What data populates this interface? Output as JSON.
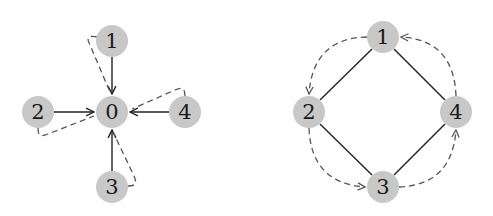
{
  "diagrams": [
    {
      "id": "star-graph",
      "description": "Star graph: center node 0 with spokes from nodes 1-4, each spoke having a dashed return/path loop",
      "nodes": [
        {
          "id": "0",
          "label": "0",
          "x": 112,
          "y": 112
        },
        {
          "id": "1",
          "label": "1",
          "x": 112,
          "y": 41
        },
        {
          "id": "2",
          "label": "2",
          "x": 38,
          "y": 112
        },
        {
          "id": "3",
          "label": "3",
          "x": 112,
          "y": 187
        },
        {
          "id": "4",
          "label": "4",
          "x": 185,
          "y": 112
        }
      ],
      "solid_edges": [
        {
          "from": "1",
          "to": "0",
          "directed": true
        },
        {
          "from": "2",
          "to": "0",
          "directed": true
        },
        {
          "from": "3",
          "to": "0",
          "directed": true
        },
        {
          "from": "4",
          "to": "0",
          "directed": true
        }
      ],
      "dashed_edges": [
        {
          "from": "1",
          "to": "0",
          "style": "hooked dashed curve"
        },
        {
          "from": "2",
          "to": "0",
          "style": "hooked dashed curve"
        },
        {
          "from": "3",
          "to": "0",
          "style": "hooked dashed curve"
        },
        {
          "from": "4",
          "to": "0",
          "style": "hooked dashed curve"
        }
      ]
    },
    {
      "id": "cycle-graph",
      "description": "Cycle graph on nodes 1-4 (diamond) with a dashed directed cycle 1→2→3→4→1 around it",
      "nodes": [
        {
          "id": "1",
          "label": "1",
          "x": 383,
          "y": 37
        },
        {
          "id": "2",
          "label": "2",
          "x": 309,
          "y": 112
        },
        {
          "id": "3",
          "label": "3",
          "x": 383,
          "y": 187
        },
        {
          "id": "4",
          "label": "4",
          "x": 456,
          "y": 112
        }
      ],
      "solid_edges": [
        {
          "from": "1",
          "to": "2",
          "directed": false
        },
        {
          "from": "2",
          "to": "3",
          "directed": false
        },
        {
          "from": "3",
          "to": "4",
          "directed": false
        },
        {
          "from": "4",
          "to": "1",
          "directed": false
        }
      ],
      "dashed_edges": [
        {
          "from": "1",
          "to": "2",
          "directed": true
        },
        {
          "from": "2",
          "to": "3",
          "directed": true
        },
        {
          "from": "3",
          "to": "4",
          "directed": true
        },
        {
          "from": "4",
          "to": "1",
          "directed": true
        }
      ]
    }
  ],
  "colors": {
    "node_fill": "#c8c8c8",
    "node_text": "#1a1a1a",
    "solid_edge": "#222222",
    "dashed_edge": "#555555",
    "background": "#ffffff"
  }
}
